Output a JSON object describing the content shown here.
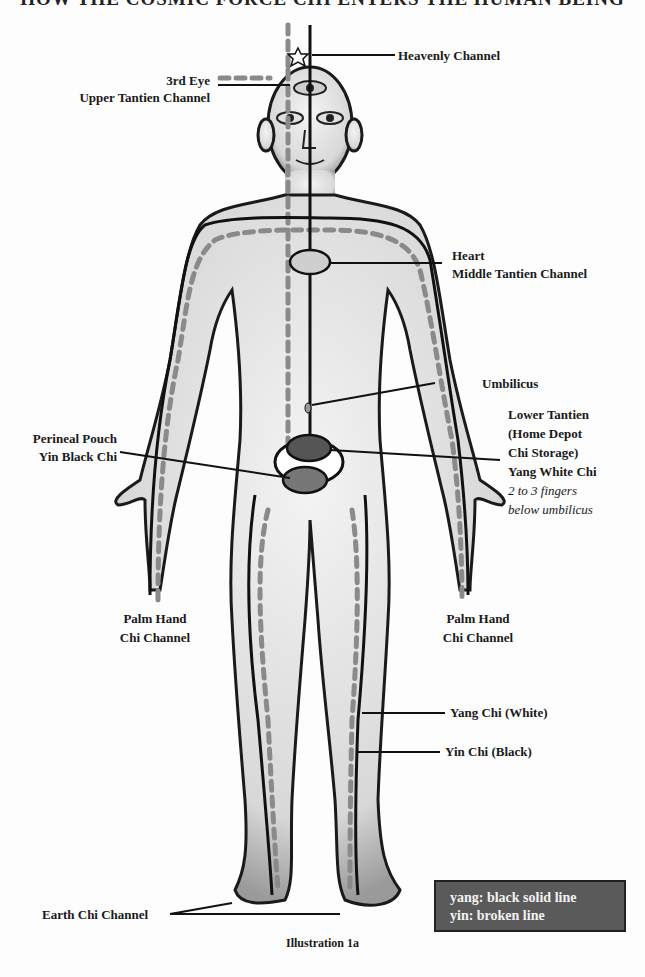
{
  "title": "HOW THE COSMIC FORCE CHI ENTERS THE HUMAN BEING",
  "labels": {
    "heavenly_channel": "Heavenly Channel",
    "third_eye": "3rd Eye",
    "upper_tantien": "Upper Tantien Channel",
    "heart": "Heart",
    "middle_tantien": "Middle Tantien Channel",
    "umbilicus": "Umbilicus",
    "lower_tantien": "Lower Tantien",
    "home_depot": "(Home Depot",
    "chi_storage": "Chi Storage)",
    "yang_white_chi": "Yang White Chi",
    "fingers_note_1": "2 to 3 fingers",
    "fingers_note_2": "below umbilicus",
    "perineal_pouch": "Perineal Pouch",
    "yin_black_chi": "Yin Black Chi",
    "palm_left_1": "Palm Hand",
    "palm_left_2": "Chi Channel",
    "palm_right_1": "Palm Hand",
    "palm_right_2": "Chi Channel",
    "yang_chi_white": "Yang Chi (White)",
    "yin_chi_black": "Yin Chi (Black)",
    "earth_chi_channel": "Earth Chi Channel"
  },
  "legend": {
    "line1": "yang: black solid line",
    "line2": "yin: broken line"
  },
  "caption": "Illustration 1a",
  "colors": {
    "yang_line": "#111111",
    "yin_line": "#8a8a8a",
    "lower_tantien_fill": "#555555",
    "perineal_fill": "#777777",
    "heart_fill": "#cfcfcf",
    "legend_bg": "#5a5a5a"
  }
}
